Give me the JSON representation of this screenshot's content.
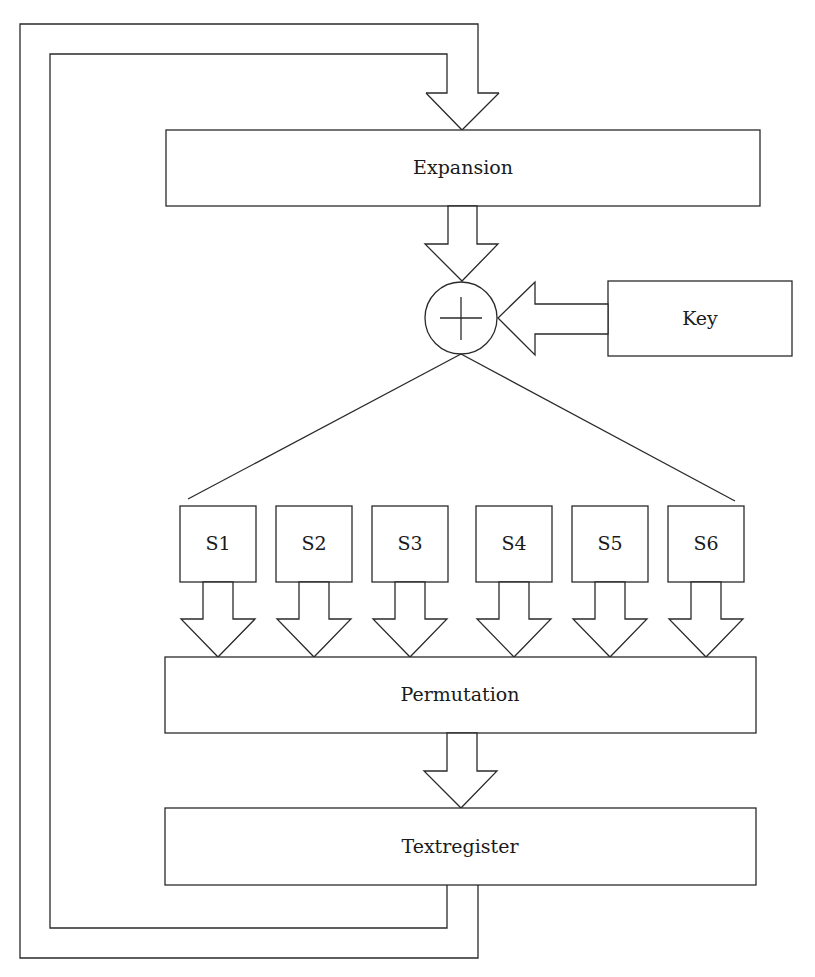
{
  "diagram": {
    "type": "block-diagram",
    "nodes": {
      "expansion": {
        "label": "Expansion"
      },
      "xor": {
        "label": "⊕",
        "symbol": "circled-plus"
      },
      "key": {
        "label": "Key"
      },
      "sboxes": [
        {
          "label": "S1"
        },
        {
          "label": "S2"
        },
        {
          "label": "S3"
        },
        {
          "label": "S4"
        },
        {
          "label": "S5"
        },
        {
          "label": "S6"
        }
      ],
      "permutation": {
        "label": "Permutation"
      },
      "textregister": {
        "label": "Textregister"
      }
    },
    "edges": [
      {
        "from": "textregister",
        "to": "expansion",
        "style": "feedback-loop-double-line"
      },
      {
        "from": "expansion",
        "to": "xor",
        "style": "hollow-arrow"
      },
      {
        "from": "key",
        "to": "xor",
        "style": "hollow-arrow"
      },
      {
        "from": "xor",
        "to": "sboxes",
        "style": "fan-out-lines"
      },
      {
        "from": "S1",
        "to": "permutation",
        "style": "hollow-arrow"
      },
      {
        "from": "S2",
        "to": "permutation",
        "style": "hollow-arrow"
      },
      {
        "from": "S3",
        "to": "permutation",
        "style": "hollow-arrow"
      },
      {
        "from": "S4",
        "to": "permutation",
        "style": "hollow-arrow"
      },
      {
        "from": "S5",
        "to": "permutation",
        "style": "hollow-arrow"
      },
      {
        "from": "S6",
        "to": "permutation",
        "style": "hollow-arrow"
      },
      {
        "from": "permutation",
        "to": "textregister",
        "style": "hollow-arrow"
      }
    ],
    "colors": {
      "stroke": "#2a2a2a",
      "fill": "#ffffff",
      "text": "#1a1a1a"
    }
  }
}
